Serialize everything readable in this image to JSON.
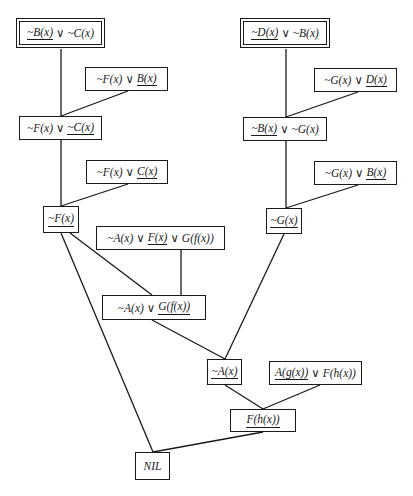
{
  "diagram": {
    "colors": {
      "stroke": "#1a1a1a",
      "background": "#ffffff"
    },
    "nodes": [
      {
        "id": "n1",
        "double": true,
        "x": 19,
        "y": 21,
        "w": 83,
        "h": 24,
        "parts": [
          {
            "t": "~B(x)",
            "u": true
          },
          {
            "op": "∨"
          },
          {
            "t": "~C(x)",
            "u": false
          }
        ]
      },
      {
        "id": "n2",
        "double": true,
        "x": 243,
        "y": 21,
        "w": 84,
        "h": 24,
        "parts": [
          {
            "t": "~D(x)",
            "u": true
          },
          {
            "op": "∨"
          },
          {
            "t": "~B(x)",
            "u": false
          }
        ]
      },
      {
        "id": "n3",
        "double": false,
        "x": 85,
        "y": 67,
        "w": 83,
        "h": 24,
        "parts": [
          {
            "t": "~F(x)",
            "u": false
          },
          {
            "op": "∨"
          },
          {
            "t": "B(x)",
            "u": true
          }
        ]
      },
      {
        "id": "n4",
        "double": false,
        "x": 314,
        "y": 68,
        "w": 83,
        "h": 24,
        "parts": [
          {
            "t": "~G(x)",
            "u": false
          },
          {
            "op": "∨"
          },
          {
            "t": "D(x)",
            "u": true
          }
        ]
      },
      {
        "id": "n5",
        "double": false,
        "x": 19,
        "y": 116,
        "w": 83,
        "h": 24,
        "parts": [
          {
            "t": "~F(x)",
            "u": false
          },
          {
            "op": "∨"
          },
          {
            "t": "~C(x)",
            "u": true
          }
        ]
      },
      {
        "id": "n6",
        "double": false,
        "x": 243,
        "y": 117,
        "w": 84,
        "h": 24,
        "parts": [
          {
            "t": "~B(x)",
            "u": true
          },
          {
            "op": "∨"
          },
          {
            "t": "~G(x)",
            "u": false
          }
        ]
      },
      {
        "id": "n7",
        "double": false,
        "x": 86,
        "y": 160,
        "w": 82,
        "h": 24,
        "parts": [
          {
            "t": "~F(x)",
            "u": false
          },
          {
            "op": "∨"
          },
          {
            "t": "C(x)",
            "u": true
          }
        ]
      },
      {
        "id": "n8",
        "double": false,
        "x": 314,
        "y": 161,
        "w": 83,
        "h": 24,
        "parts": [
          {
            "t": "~G(x)",
            "u": false
          },
          {
            "op": "∨"
          },
          {
            "t": "B(x)",
            "u": true
          }
        ]
      },
      {
        "id": "n9",
        "double": false,
        "x": 43,
        "y": 206,
        "w": 36,
        "h": 27,
        "parts": [
          {
            "t": "~F(x)",
            "u": true
          }
        ]
      },
      {
        "id": "n10",
        "double": false,
        "x": 266,
        "y": 208,
        "w": 36,
        "h": 26,
        "parts": [
          {
            "t": "~G(x)",
            "u": true
          }
        ]
      },
      {
        "id": "n11",
        "double": false,
        "x": 96,
        "y": 226,
        "w": 129,
        "h": 24,
        "parts": [
          {
            "t": "~A(x)",
            "u": false
          },
          {
            "op": "∨"
          },
          {
            "t": "F(x)",
            "u": true
          },
          {
            "op": "∨"
          },
          {
            "t": "G(f(x))",
            "u": false
          }
        ]
      },
      {
        "id": "n12",
        "double": false,
        "x": 102,
        "y": 295,
        "w": 104,
        "h": 25,
        "parts": [
          {
            "t": "~A(x)",
            "u": false
          },
          {
            "op": "∨"
          },
          {
            "t": "G(f(x))",
            "u": true
          }
        ]
      },
      {
        "id": "n13",
        "double": false,
        "x": 207,
        "y": 359,
        "w": 35,
        "h": 26,
        "parts": [
          {
            "t": "~A(x)",
            "u": true
          }
        ]
      },
      {
        "id": "n14",
        "double": false,
        "x": 269,
        "y": 361,
        "w": 93,
        "h": 24,
        "parts": [
          {
            "t": "A(g(x))",
            "u": true
          },
          {
            "op": "∨"
          },
          {
            "t": "F(h(x))",
            "u": false
          }
        ]
      },
      {
        "id": "n15",
        "double": false,
        "x": 230,
        "y": 409,
        "w": 66,
        "h": 23,
        "parts": [
          {
            "t": "F(h(x))",
            "u": true
          }
        ]
      },
      {
        "id": "n16",
        "double": false,
        "x": 135,
        "y": 452,
        "w": 35,
        "h": 28,
        "parts": [
          {
            "t": "NIL",
            "u": false
          }
        ]
      }
    ],
    "edges": [
      {
        "from": "n1",
        "to": "n5",
        "x1": 61,
        "y1": 49,
        "x2": 61,
        "y2": 116
      },
      {
        "from": "n3",
        "to": "n5",
        "x1": 128,
        "y1": 91,
        "x2": 61,
        "y2": 116
      },
      {
        "from": "n2",
        "to": "n6",
        "x1": 286,
        "y1": 49,
        "x2": 286,
        "y2": 117
      },
      {
        "from": "n4",
        "to": "n6",
        "x1": 358,
        "y1": 92,
        "x2": 286,
        "y2": 117
      },
      {
        "from": "n5",
        "to": "n9",
        "x1": 61,
        "y1": 140,
        "x2": 61,
        "y2": 206
      },
      {
        "from": "n7",
        "to": "n9",
        "x1": 128,
        "y1": 184,
        "x2": 61,
        "y2": 206
      },
      {
        "from": "n6",
        "to": "n10",
        "x1": 286,
        "y1": 141,
        "x2": 286,
        "y2": 208
      },
      {
        "from": "n8",
        "to": "n10",
        "x1": 358,
        "y1": 185,
        "x2": 286,
        "y2": 208
      },
      {
        "from": "n9",
        "to": "n12",
        "x1": 70,
        "y1": 233,
        "x2": 152,
        "y2": 295
      },
      {
        "from": "n11",
        "to": "n12",
        "x1": 181,
        "y1": 250,
        "x2": 181,
        "y2": 295
      },
      {
        "from": "n12",
        "to": "n13",
        "x1": 152,
        "y1": 320,
        "x2": 225,
        "y2": 359
      },
      {
        "from": "n10",
        "to": "n13",
        "x1": 284,
        "y1": 234,
        "x2": 225,
        "y2": 359
      },
      {
        "from": "n13",
        "to": "n15",
        "x1": 225,
        "y1": 385,
        "x2": 263,
        "y2": 409
      },
      {
        "from": "n14",
        "to": "n15",
        "x1": 320,
        "y1": 385,
        "x2": 263,
        "y2": 409
      },
      {
        "from": "n9",
        "to": "n16",
        "x1": 61,
        "y1": 233,
        "x2": 153,
        "y2": 452
      },
      {
        "from": "n15",
        "to": "n16",
        "x1": 263,
        "y1": 432,
        "x2": 153,
        "y2": 452
      }
    ]
  }
}
